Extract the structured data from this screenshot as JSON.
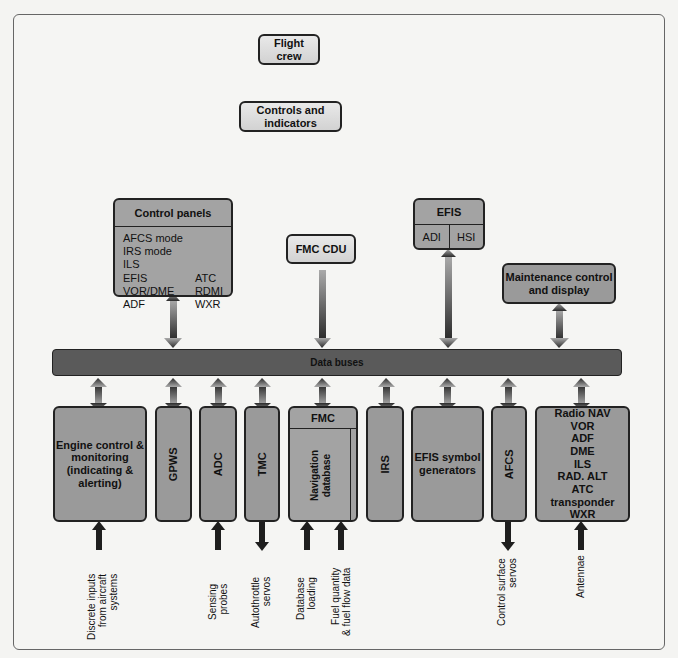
{
  "top": {
    "flight_crew": "Flight crew",
    "controls_indicators": "Controls and indicators"
  },
  "control_panels": {
    "title": "Control panels",
    "items": [
      [
        "AFCS mode",
        ""
      ],
      [
        "IRS mode",
        ""
      ],
      [
        "ILS",
        ""
      ],
      [
        "EFIS",
        "ATC"
      ],
      [
        "VOR/DME",
        "RDMI"
      ],
      [
        "ADF",
        "WXR"
      ]
    ]
  },
  "fmc_cdu": "FMC CDU",
  "efis": {
    "title": "EFIS",
    "left": "ADI",
    "right": "HSI"
  },
  "maintenance": "Maintenance control and display",
  "bus": "Data buses",
  "bottom": {
    "engine": "Engine control & monitoring (indicating & alerting)",
    "gpws": "GPWS",
    "adc": "ADC",
    "tmc": "TMC",
    "fmc": {
      "title": "FMC",
      "nav": "Navigation database",
      "op": "Operational program"
    },
    "irs": "IRS",
    "efis_sg": "EFIS symbol generators",
    "afcs": "AFCS",
    "radio": [
      "Radio NAV",
      "VOR",
      "ADF",
      "DME",
      "ILS",
      "RAD. ALT",
      "ATC",
      "transponder",
      "WXR"
    ]
  },
  "inputs": {
    "discrete": "Discrete inputs\nfrom aircraft\nsystems",
    "sensing": "Sensing\nprobes",
    "autothrottle": "Autothrottle\nservos",
    "database": "Database\nloading",
    "fuel": "Fuel quantity\n& fuel flow data",
    "control_surface": "Control surface\nservos",
    "antennae": "Antennae"
  },
  "colors": {
    "box_dark": "#9a9a9a",
    "box_light": "#dcdcdc",
    "bus": "#5a5a5a",
    "arrow_dark": "#2a2a2a",
    "arrow_light": "#aaaaaa"
  }
}
